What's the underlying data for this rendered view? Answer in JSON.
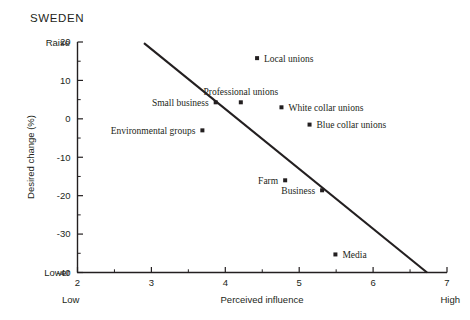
{
  "chart_data": {
    "type": "scatter",
    "title": "SWEDEN",
    "xlabel": "Perceived influence",
    "ylabel": "Desired change (%)",
    "xlim": [
      2,
      7
    ],
    "ylim": [
      -40,
      20
    ],
    "xticks": [
      "2",
      "3",
      "4",
      "5",
      "6",
      "7"
    ],
    "yticks": [
      "20",
      "10",
      "0",
      "-10",
      "-20",
      "-30",
      "-40"
    ],
    "x_axis_low_label": "Low",
    "x_axis_high_label": "High",
    "y_axis_top_label": "Raise",
    "y_axis_bottom_label": "Lower",
    "grid": false,
    "legend": "none",
    "points": [
      {
        "label": "Local unions",
        "x": 4.43,
        "y": 15.8,
        "label_side": "right"
      },
      {
        "label": "Small business",
        "x": 3.87,
        "y": 4.3,
        "label_side": "left"
      },
      {
        "label": "Professional unions",
        "x": 4.21,
        "y": 4.3,
        "label_side": "above"
      },
      {
        "label": "White collar unions",
        "x": 4.76,
        "y": 3.0,
        "label_side": "right"
      },
      {
        "label": "Blue collar unions",
        "x": 5.14,
        "y": -1.5,
        "label_side": "right"
      },
      {
        "label": "Environmental groups",
        "x": 3.69,
        "y": -3.0,
        "label_side": "left"
      },
      {
        "label": "Farm",
        "x": 4.81,
        "y": -16.0,
        "label_side": "left"
      },
      {
        "label": "Business",
        "x": 5.31,
        "y": -18.6,
        "label_side": "left"
      },
      {
        "label": "Media",
        "x": 5.49,
        "y": -35.3,
        "label_side": "right"
      }
    ],
    "trendline": {
      "x1": 2.9,
      "y1": 19.7,
      "x2": 6.73,
      "y2": -40.0
    }
  }
}
